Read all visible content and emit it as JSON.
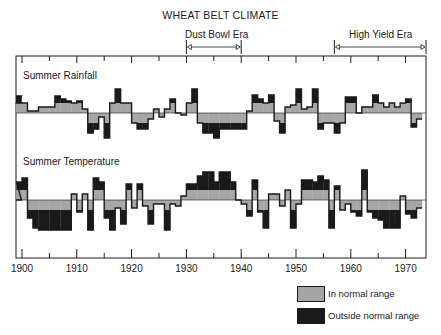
{
  "chart_data": {
    "type": "area",
    "title": "WHEAT BELT CLIMATE",
    "xlabel": "",
    "ylabel": "",
    "x_range": [
      1899,
      1974
    ],
    "x_ticks": [
      1900,
      1910,
      1920,
      1930,
      1940,
      1950,
      1960,
      1970
    ],
    "x_tick_labels": [
      "1900",
      "1910",
      "1920",
      "1930",
      "1940",
      "1950",
      "1960",
      "1970"
    ],
    "annotations": [
      {
        "label": "Dust Bowl Era",
        "start": 1930,
        "end": 1940
      },
      {
        "label": "High Yield Era",
        "start": 1957,
        "end": 1974
      }
    ],
    "legend": [
      {
        "label": "In normal range",
        "color": "#a6a6a6"
      },
      {
        "label": "Outside normal range",
        "color": "#1a1a1a"
      }
    ],
    "normal_range": [
      -10,
      10
    ],
    "units": "relative deviation from average (approx.)",
    "series": [
      {
        "name": "Summer Rainfall",
        "years": [
          1899,
          1900,
          1901,
          1902,
          1903,
          1904,
          1905,
          1906,
          1907,
          1908,
          1909,
          1910,
          1911,
          1912,
          1913,
          1914,
          1915,
          1916,
          1917,
          1918,
          1919,
          1920,
          1921,
          1922,
          1923,
          1924,
          1925,
          1926,
          1927,
          1928,
          1929,
          1930,
          1931,
          1932,
          1933,
          1934,
          1935,
          1936,
          1937,
          1938,
          1939,
          1940,
          1941,
          1942,
          1943,
          1944,
          1945,
          1946,
          1947,
          1948,
          1949,
          1950,
          1951,
          1952,
          1953,
          1954,
          1955,
          1956,
          1957,
          1958,
          1959,
          1960,
          1961,
          1962,
          1963,
          1964,
          1965,
          1966,
          1967,
          1968,
          1969,
          1970,
          1971,
          1972,
          1973
        ],
        "values": [
          17,
          10,
          10,
          2,
          2,
          6,
          6,
          6,
          17,
          14,
          12,
          10,
          12,
          4,
          -20,
          -16,
          -4,
          -25,
          10,
          24,
          10,
          10,
          -10,
          -16,
          -16,
          -6,
          4,
          -4,
          4,
          14,
          0,
          -2,
          10,
          24,
          -10,
          -20,
          -20,
          -25,
          -16,
          -16,
          -16,
          -16,
          -16,
          2,
          18,
          14,
          10,
          18,
          -8,
          -20,
          6,
          8,
          24,
          4,
          6,
          24,
          -16,
          -10,
          -10,
          -20,
          -10,
          16,
          16,
          0,
          6,
          6,
          18,
          10,
          6,
          10,
          6,
          10,
          14,
          -14,
          -6
        ]
      },
      {
        "name": "Summer Temperature",
        "years": [
          1899,
          1900,
          1901,
          1902,
          1903,
          1904,
          1905,
          1906,
          1907,
          1908,
          1909,
          1910,
          1911,
          1912,
          1913,
          1914,
          1915,
          1916,
          1917,
          1918,
          1919,
          1920,
          1921,
          1922,
          1923,
          1924,
          1925,
          1926,
          1927,
          1928,
          1929,
          1930,
          1931,
          1932,
          1933,
          1934,
          1935,
          1936,
          1937,
          1938,
          1939,
          1940,
          1941,
          1942,
          1943,
          1944,
          1945,
          1946,
          1947,
          1948,
          1949,
          1950,
          1951,
          1952,
          1953,
          1954,
          1955,
          1956,
          1957,
          1958,
          1959,
          1960,
          1961,
          1962,
          1963,
          1964,
          1965,
          1966,
          1967,
          1968,
          1969,
          1970,
          1971,
          1972,
          1973
        ],
        "values": [
          0,
          18,
          22,
          -18,
          -28,
          -30,
          -30,
          -30,
          -30,
          -30,
          -30,
          6,
          -12,
          6,
          -30,
          22,
          18,
          -18,
          -30,
          -8,
          -24,
          16,
          -8,
          16,
          -6,
          -24,
          -4,
          -4,
          -30,
          -4,
          -6,
          4,
          16,
          16,
          24,
          28,
          28,
          18,
          28,
          28,
          18,
          0,
          -4,
          -16,
          20,
          -12,
          -28,
          6,
          6,
          -6,
          10,
          -28,
          -4,
          20,
          20,
          18,
          24,
          20,
          -28,
          14,
          -10,
          -4,
          -12,
          -16,
          30,
          -12,
          -18,
          -20,
          -28,
          -28,
          -28,
          4,
          -14,
          -18,
          -8
        ]
      }
    ]
  },
  "header": {
    "title": "WHEAT BELT CLIMATE",
    "eras": [
      {
        "label": "Dust Bowl Era"
      },
      {
        "label": "High Yield Era"
      }
    ]
  },
  "rows": [
    {
      "label": "Summer Rainfall"
    },
    {
      "label": "Summer Temperature"
    }
  ],
  "axis": {
    "ticks": [
      "1900",
      "1910",
      "1920",
      "1930",
      "1940",
      "1950",
      "1960",
      "1970"
    ]
  },
  "legend": {
    "items": [
      {
        "label": "In normal range",
        "color": "#a6a6a6"
      },
      {
        "label": "Outside normal range",
        "color": "#1a1a1a"
      }
    ]
  }
}
